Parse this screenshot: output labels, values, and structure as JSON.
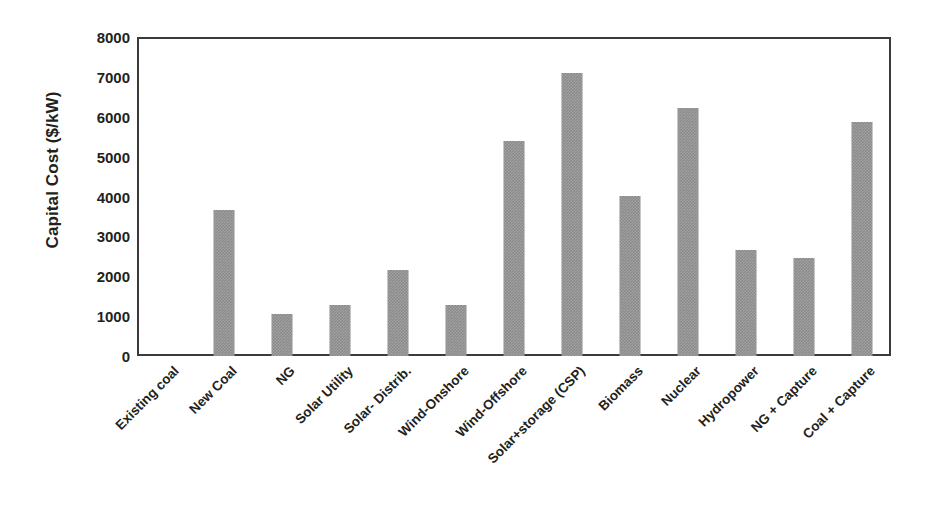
{
  "chart_data": {
    "type": "bar",
    "title": "",
    "xlabel": "",
    "ylabel": "Capital Cost ($/kW)",
    "ylim": [
      0,
      8000
    ],
    "ytick_labels": [
      "8000",
      "7000",
      "6000",
      "5000",
      "4000",
      "3000",
      "2000",
      "1000",
      "0"
    ],
    "yticks": [
      8000,
      7000,
      6000,
      5000,
      4000,
      3000,
      2000,
      1000,
      0
    ],
    "grid": false,
    "legend": false,
    "bar_color": "#8a8a8a",
    "frame_color": "#3b3b3b",
    "text_color": "#231f20",
    "categories": [
      "Existing coal",
      "New Coal",
      "NG",
      "Solar Utility",
      "Solar- Distrib.",
      "Wind-Onshore",
      "Wind-Offshore",
      "Solar+storage (CSP)",
      "Biomass",
      "Nuclear",
      "Hydropower",
      "NG + Capture",
      "Coal + Capture"
    ],
    "values": [
      0,
      3650,
      1050,
      1290,
      2150,
      1270,
      5380,
      7110,
      4020,
      6220,
      2670,
      2470,
      5860
    ]
  }
}
